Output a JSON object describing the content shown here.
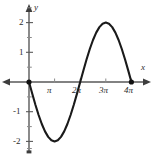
{
  "chart_data": {
    "type": "line",
    "title": "",
    "subtitle": "",
    "xlabel": "x",
    "ylabel": "y",
    "function": "y = -2 sin(x/2)",
    "xlim": [
      -0.6,
      13.8
    ],
    "ylim": [
      -2.6,
      2.6
    ],
    "grid": false,
    "legend": null,
    "x_tick_labels": [
      "π",
      "2π",
      "3π",
      "4π"
    ],
    "x_tick_values": [
      3.1416,
      6.2832,
      9.4248,
      12.5664
    ],
    "y_tick_labels": [
      "2",
      "1",
      "-1",
      "-2"
    ],
    "y_tick_values": [
      2,
      1,
      -1,
      -2
    ],
    "y_minor_ticks": [
      2.5,
      1.5,
      0.5,
      -0.5,
      -1.5,
      -2.5
    ],
    "x_minor_ticks": [],
    "series": [
      {
        "name": "y = -2 sin(x/2)",
        "x": [
          0,
          0.3927,
          0.7854,
          1.1781,
          1.5708,
          1.9635,
          2.3562,
          2.7489,
          3.1416,
          3.5343,
          3.927,
          4.3197,
          4.7124,
          5.1051,
          5.4978,
          5.8905,
          6.2832,
          6.6759,
          7.0686,
          7.4613,
          7.854,
          8.2467,
          8.6394,
          9.0321,
          9.4248,
          9.8175,
          10.2102,
          10.6029,
          10.9956,
          11.3883,
          11.781,
          12.1737,
          12.5664
        ],
        "y": [
          0,
          -0.3902,
          -0.7654,
          -1.1111,
          -1.4142,
          -1.6629,
          -1.8478,
          -1.9616,
          -2.0,
          -1.9616,
          -1.8478,
          -1.6629,
          -1.4142,
          -1.1111,
          -0.7654,
          -0.3902,
          0,
          0.3902,
          0.7654,
          1.1111,
          1.4142,
          1.6629,
          1.8478,
          1.9616,
          2.0,
          1.9616,
          1.8478,
          1.6629,
          1.4142,
          1.1111,
          0.7654,
          0.3902,
          0
        ]
      }
    ],
    "markers": [
      {
        "label": "origin-endpoint",
        "x": 0,
        "y": 0,
        "style": "filled-dot"
      },
      {
        "label": "right-endpoint",
        "x": 12.5664,
        "y": 0,
        "style": "filled-dot"
      }
    ],
    "colors": {
      "curve": "#1a1a1a",
      "axis": "#4d4d4d",
      "text": "#2b2b2b",
      "background": "#ffffff"
    }
  },
  "axes": {
    "x_axis_name": "x",
    "y_axis_name": "y"
  },
  "labels": {
    "x": [
      {
        "text": "π",
        "left": 47,
        "top": 86
      },
      {
        "text": "2π",
        "left": 72,
        "top": 86
      },
      {
        "text": "3π",
        "left": 99,
        "top": 86
      },
      {
        "text": "4π",
        "left": 124,
        "top": 86
      }
    ],
    "y": [
      {
        "text": "2",
        "left": 19,
        "top": 19
      },
      {
        "text": "1",
        "left": 19,
        "top": 48
      },
      {
        "text": "-1",
        "left": 14,
        "top": 109
      },
      {
        "text": "-2",
        "left": 14,
        "top": 139
      }
    ]
  }
}
